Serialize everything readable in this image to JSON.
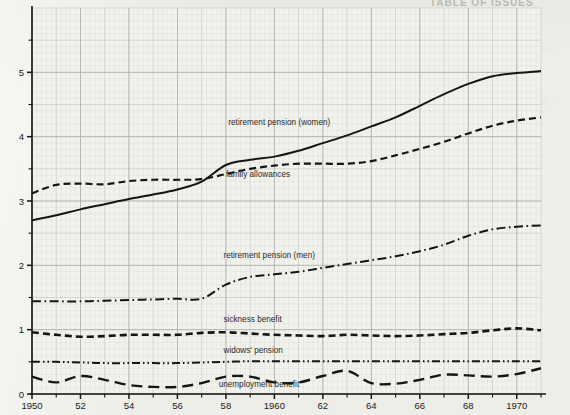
{
  "figure": {
    "ghost_header": "TABLE  OF  ISSUES",
    "background_color": "#eeeee8",
    "ink_color": "#151515",
    "grid_minor_color": "#c9c9c9",
    "grid_major_color": "#a8a8a8"
  },
  "chart_data": {
    "type": "line",
    "title": "",
    "subtitle": "",
    "xlabel": "",
    "ylabel": "",
    "xlim": [
      1950,
      1971
    ],
    "ylim": [
      0,
      6
    ],
    "grid": true,
    "legend": "inline-annotations",
    "y_ticks": [
      0,
      1,
      2,
      3,
      4,
      5
    ],
    "y_tick_labels": [
      "0",
      "1",
      "2",
      "3",
      "4",
      "5"
    ],
    "y_minor_ticks": [
      0.5,
      1.5,
      2.5,
      3.5,
      4.5,
      5.5
    ],
    "x_ticks": [
      1950,
      1951,
      1952,
      1953,
      1954,
      1955,
      1956,
      1957,
      1958,
      1959,
      1960,
      1961,
      1962,
      1963,
      1964,
      1965,
      1966,
      1967,
      1968,
      1969,
      1970,
      1971
    ],
    "x_tick_labels": [
      "1950",
      "",
      "52",
      "",
      "54",
      "",
      "56",
      "",
      "58",
      "",
      "1960",
      "",
      "62",
      "",
      "64",
      "",
      "66",
      "",
      "68",
      "",
      "1970",
      ""
    ],
    "x": [
      1950,
      1951,
      1952,
      1953,
      1954,
      1955,
      1956,
      1957,
      1958,
      1959,
      1960,
      1961,
      1962,
      1963,
      1964,
      1965,
      1966,
      1967,
      1968,
      1969,
      1970,
      1971
    ],
    "series": [
      {
        "name": "retirement pension  (women)",
        "label": "retirement pension   (women)",
        "dash": "solid",
        "width": 2.0,
        "label_x": 1958.1,
        "label_y": 4.18,
        "values": [
          2.7,
          2.78,
          2.87,
          2.95,
          3.03,
          3.1,
          3.18,
          3.3,
          3.56,
          3.64,
          3.69,
          3.78,
          3.9,
          4.02,
          4.16,
          4.3,
          4.48,
          4.66,
          4.82,
          4.94,
          4.99,
          5.02
        ]
      },
      {
        "name": "family allowances",
        "label": "family allowances",
        "dash": "dashed",
        "width": 2.2,
        "label_x": 1958.0,
        "label_y": 3.37,
        "values": [
          3.12,
          3.25,
          3.27,
          3.26,
          3.31,
          3.33,
          3.33,
          3.34,
          3.42,
          3.5,
          3.55,
          3.58,
          3.58,
          3.58,
          3.62,
          3.71,
          3.81,
          3.92,
          4.05,
          4.17,
          4.25,
          4.3
        ]
      },
      {
        "name": "retirement pension  (men)",
        "label": "retirement pension   (men)",
        "dash": "dashdot",
        "width": 2.0,
        "label_x": 1957.9,
        "label_y": 2.12,
        "values": [
          1.44,
          1.44,
          1.44,
          1.45,
          1.46,
          1.47,
          1.48,
          1.48,
          1.7,
          1.82,
          1.86,
          1.9,
          1.96,
          2.02,
          2.08,
          2.14,
          2.22,
          2.32,
          2.46,
          2.56,
          2.6,
          2.62
        ]
      },
      {
        "name": "sickness benefit",
        "label": "sickness benefit",
        "dash": "dashed",
        "width": 2.6,
        "label_x": 1957.9,
        "label_y": 1.12,
        "values": [
          0.96,
          0.92,
          0.89,
          0.9,
          0.92,
          0.92,
          0.92,
          0.95,
          0.96,
          0.94,
          0.92,
          0.91,
          0.9,
          0.92,
          0.91,
          0.9,
          0.91,
          0.93,
          0.95,
          0.99,
          1.02,
          0.99
        ]
      },
      {
        "name": "widows' pension",
        "label": "widows'  pension",
        "dash": "dashdotdot",
        "width": 2.0,
        "label_x": 1957.9,
        "label_y": 0.63,
        "values": [
          0.5,
          0.5,
          0.49,
          0.48,
          0.48,
          0.48,
          0.48,
          0.49,
          0.5,
          0.51,
          0.51,
          0.51,
          0.51,
          0.51,
          0.51,
          0.51,
          0.51,
          0.51,
          0.51,
          0.51,
          0.51,
          0.51
        ]
      },
      {
        "name": "unemployment benefit",
        "label": "unemployment benefit",
        "dash": "longdash",
        "width": 2.4,
        "label_x": 1957.7,
        "label_y": 0.11,
        "values": [
          0.27,
          0.18,
          0.28,
          0.22,
          0.14,
          0.11,
          0.11,
          0.17,
          0.27,
          0.27,
          0.18,
          0.18,
          0.28,
          0.36,
          0.17,
          0.16,
          0.22,
          0.3,
          0.29,
          0.27,
          0.31,
          0.4
        ]
      }
    ]
  }
}
